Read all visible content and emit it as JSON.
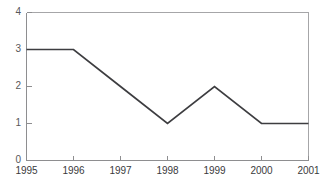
{
  "chart_data": {
    "type": "line",
    "title": "",
    "subtitle": "",
    "xlabel": "",
    "ylabel": "",
    "categories": [
      "1995",
      "1996",
      "1997",
      "1998",
      "1999",
      "2000",
      "2001"
    ],
    "x": [
      1995,
      1996,
      1997,
      1998,
      1999,
      2000,
      2001
    ],
    "values": [
      3,
      3,
      2,
      1,
      2,
      1,
      1
    ],
    "series": [
      {
        "name": "",
        "values": [
          3,
          3,
          2,
          1,
          2,
          1,
          1
        ]
      }
    ],
    "xlim": [
      1995,
      2001
    ],
    "ylim": [
      0,
      4
    ],
    "ytick_labels": [
      "0",
      "1",
      "2",
      "3",
      "4"
    ],
    "ytick_values": [
      0,
      1,
      2,
      3,
      4
    ],
    "xtick_labels": [
      "1995",
      "1996",
      "1997",
      "1998",
      "1999",
      "2000",
      "2001"
    ],
    "grid": false,
    "legend": null,
    "legend_position": "none",
    "annotations": [],
    "colors": {
      "line": "#3d3d40",
      "frame": "#a6a6a8",
      "axis": "#8e8e90",
      "tick_label": "#3a3a3c",
      "ytick_label": "#58585a",
      "background": "#ffffff"
    }
  },
  "axes": {
    "y": {
      "ticks": [
        {
          "label": "4",
          "value": 4
        },
        {
          "label": "3",
          "value": 3
        },
        {
          "label": "2",
          "value": 2
        },
        {
          "label": "1",
          "value": 1
        },
        {
          "label": "0",
          "value": 0
        }
      ]
    },
    "x": {
      "ticks": [
        {
          "label": "1995",
          "value": 1995
        },
        {
          "label": "1996",
          "value": 1996
        },
        {
          "label": "1997",
          "value": 1997
        },
        {
          "label": "1998",
          "value": 1998
        },
        {
          "label": "1999",
          "value": 1999
        },
        {
          "label": "2000",
          "value": 2000
        },
        {
          "label": "2001",
          "value": 2001
        }
      ]
    }
  },
  "caption": {
    "cut_off_text": ""
  }
}
